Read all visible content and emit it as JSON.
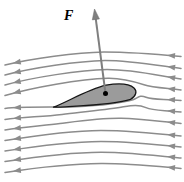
{
  "diagram": {
    "force_label": "F",
    "canvas": {
      "width": 184,
      "height": 182
    },
    "colors": {
      "background": "#ffffff",
      "streamline": "#8c8c8c",
      "airfoil_fill": "#9b9b9b",
      "airfoil_outline": "#161616",
      "force_arrow": "#7f7f7f",
      "force_arrow_edge": "#6b6b6b",
      "dot": "#000000",
      "label": "#000000"
    },
    "streamline_width": 1.5,
    "arrowheads": {
      "length": 8,
      "half_width": 2.9,
      "inset_start": 14,
      "inset_end": 8
    },
    "streamlines": [
      "M 181,56.5 C 160,54.5 130,52 104,52 C 76,52.5 32,58.5 5,65",
      "M 181,68.5 C 158,65.5 130,60.5 105,60.5 C 78,61 32,68 5,75",
      "M 181,79 C 158,75.5 133,69.5 107,69.5 C 80,70 32,77.5 5,85",
      "M 181,90 C 164,88 152,87.5 144,84.8 C 134,81.4 121,78 108,78.2 C 80,79 32,87.5 5,95.5",
      "M 181,100.5 C 164,98.8 153,100 146,97.2 C 139,94.4 138,98.3 133,99.8 C 118,104 96,105.8 76,106.8 C 58,107.6 22,106.3 5,108.5",
      "M 181,112 C 163,110 153,110.8 146,107.6 C 138,104 131,105.6 121,107.2 C 104,109.8 82,112 62,114.4 C 42,116.8 22,117 5,119.5",
      "M 181,123.5 C 156,121 141,118.6 121,118.3 C 101,118 80,121 60,123.5 C 42,125.7 22,127.3 5,130",
      "M 181,136 C 152,132.8 126,130.4 101,130.4 C 76,130.5 38,135.2 5,140.5",
      "M 181,147 C 152,143.8 126,141.4 101,141.4 C 76,141.5 38,145.8 5,151",
      "M 181,158 C 152,155 126,152.2 101,152.2 C 76,152.3 38,156.5 5,161.5",
      "M 181,168.5 C 152,166 126,163.4 101,163.6 C 76,163.8 38,167.5 5,172.5"
    ],
    "airfoil": {
      "path": "M 53.5,107.2 C 68,101.5 88,89.5 106,85.2 C 118,83.2 129,83.6 134,88 C 137.5,91.2 136,96.5 130.5,99.3 C 118,103.8 92,105.2 72,106.3 C 64,106.8 57,107.2 53.5,107.2 Z",
      "outline_width": 1.3,
      "dot": {
        "x": 105.5,
        "y": 93.5,
        "r": 2.5
      }
    },
    "force_vector": {
      "from": {
        "x": 105.5,
        "y": 93.5
      },
      "to": {
        "x": 94.5,
        "y": 9
      },
      "shaft_width": 2,
      "head_length": 10.5,
      "head_half_width": 3.6,
      "label_x": 64,
      "label_y": 20,
      "label_font_size": 14
    }
  }
}
